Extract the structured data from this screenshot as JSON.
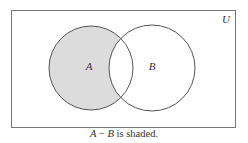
{
  "diagram": {
    "type": "venn",
    "universe_label": "U",
    "sets": [
      {
        "label": "A",
        "cx": 91,
        "cy": 68,
        "r": 42
      },
      {
        "label": "B",
        "cx": 152,
        "cy": 68,
        "r": 43
      }
    ],
    "shaded_region": "A - B",
    "colors": {
      "shade": "#dcdcdc",
      "stroke": "#555555",
      "border": "#777777",
      "background": "#ffffff"
    }
  },
  "caption": {
    "set_a": "A",
    "minus": " − ",
    "set_b": "B",
    "rest": " is shaded."
  }
}
